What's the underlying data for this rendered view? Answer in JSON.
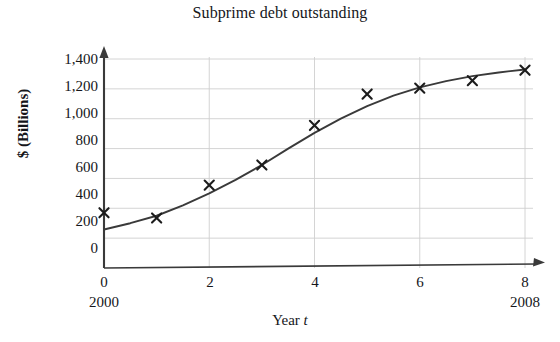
{
  "chart_data": {
    "type": "scatter",
    "title": "Subprime debt outstanding",
    "xlabel": "Year t",
    "xlabel_plain": "Year",
    "xlabel_italic": "t",
    "ylabel": "$ (Billions)",
    "xlim": [
      0,
      8
    ],
    "ylim": [
      0,
      1400
    ],
    "grid": true,
    "legend": null,
    "x_tick_labels": [
      "0",
      "2",
      "4",
      "6",
      "8"
    ],
    "x_ticks": [
      0,
      2,
      4,
      6,
      8
    ],
    "x_secondary_labels": [
      {
        "x": 0,
        "label": "2000"
      },
      {
        "x": 8,
        "label": "2008"
      }
    ],
    "y_tick_labels": [
      "0",
      "200",
      "400",
      "600",
      "800",
      "1,000",
      "1,200",
      "1,400"
    ],
    "y_ticks": [
      0,
      200,
      400,
      600,
      800,
      1000,
      1200,
      1400
    ],
    "series": [
      {
        "name": "Subprime debt outstanding",
        "marker": "x",
        "x": [
          0,
          1,
          2,
          3,
          4,
          5,
          6,
          7,
          8
        ],
        "values": [
          370,
          335,
          555,
          690,
          955,
          1165,
          1205,
          1255,
          1325
        ]
      },
      {
        "name": "Logistic fit curve",
        "type": "line",
        "x": [
          0,
          0.5,
          1,
          1.5,
          2,
          2.5,
          3,
          3.5,
          4,
          4.5,
          5,
          5.5,
          6,
          6.5,
          7,
          7.5,
          8
        ],
        "values": [
          258,
          300,
          350,
          420,
          500,
          590,
          690,
          800,
          905,
          1000,
          1085,
          1155,
          1210,
          1252,
          1285,
          1310,
          1330
        ]
      }
    ],
    "colors": {
      "axis": "#3a3a3a",
      "grid": "#cfcfcf",
      "curve": "#3a3a3a",
      "marker": "#1c1c1c",
      "background": "#ffffff",
      "text": "#15161a"
    }
  }
}
